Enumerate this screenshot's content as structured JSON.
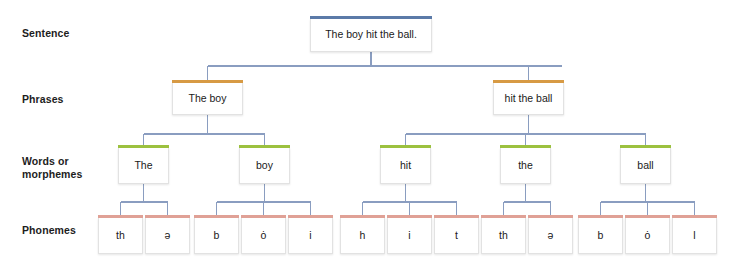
{
  "diagram": {
    "colors": {
      "sentence_cap": "#5b7aa8",
      "phrase_cap": "#d79a44",
      "word_cap": "#9cc13f",
      "phoneme_cap": "#e0a196",
      "connector": "#8a9dc0",
      "box_fill": "#ffffff",
      "box_border": "#e2e2e2",
      "label_text": "#1d1d1d"
    },
    "row_labels": [
      {
        "id": "sentence",
        "text": "Sentence",
        "y": 27
      },
      {
        "id": "phrases",
        "text": "Phrases",
        "y": 93
      },
      {
        "id": "words",
        "text": "Words or\nmorphemes",
        "y": 155
      },
      {
        "id": "phonemes",
        "text": "Phonemes",
        "y": 224
      }
    ],
    "levels": {
      "sentence": {
        "label": "Sentence",
        "nodes": [
          {
            "id": "s1",
            "text": "The boy hit the ball.",
            "x": 310,
            "y": 19,
            "w": 122,
            "h": 33
          }
        ]
      },
      "phrases": {
        "label": "Phrases",
        "nodes": [
          {
            "id": "p1",
            "text": "The boy",
            "x": 172,
            "y": 83,
            "w": 71,
            "h": 32
          },
          {
            "id": "p2",
            "text": "hit the ball",
            "x": 493,
            "y": 83,
            "w": 71,
            "h": 32
          }
        ]
      },
      "words": {
        "label": "Words or morphemes",
        "nodes": [
          {
            "id": "w1",
            "text": "The",
            "x": 118,
            "y": 148,
            "w": 51,
            "h": 36
          },
          {
            "id": "w2",
            "text": "boy",
            "x": 239,
            "y": 148,
            "w": 51,
            "h": 36
          },
          {
            "id": "w3",
            "text": "hit",
            "x": 380,
            "y": 148,
            "w": 51,
            "h": 36
          },
          {
            "id": "w4",
            "text": "the",
            "x": 500,
            "y": 148,
            "w": 51,
            "h": 36
          },
          {
            "id": "w5",
            "text": "ball",
            "x": 620,
            "y": 148,
            "w": 51,
            "h": 36
          }
        ]
      },
      "phonemes": {
        "label": "Phonemes",
        "nodes": [
          {
            "id": "ph1",
            "text": "th",
            "x": 98,
            "y": 218,
            "w": 45,
            "h": 36,
            "parent": "w1"
          },
          {
            "id": "ph2",
            "text": "ə",
            "x": 145,
            "y": 218,
            "w": 45,
            "h": 36,
            "parent": "w1"
          },
          {
            "id": "ph3",
            "text": "b",
            "x": 194,
            "y": 218,
            "w": 45,
            "h": 36,
            "parent": "w2"
          },
          {
            "id": "ph4",
            "text": "ȯ",
            "x": 241,
            "y": 218,
            "w": 45,
            "h": 36,
            "parent": "w2"
          },
          {
            "id": "ph5",
            "text": "i",
            "x": 288,
            "y": 218,
            "w": 45,
            "h": 36,
            "parent": "w2"
          },
          {
            "id": "ph6",
            "text": "h",
            "x": 340,
            "y": 218,
            "w": 45,
            "h": 36,
            "parent": "w3"
          },
          {
            "id": "ph7",
            "text": "i",
            "x": 387,
            "y": 218,
            "w": 45,
            "h": 36,
            "parent": "w3"
          },
          {
            "id": "ph8",
            "text": "t",
            "x": 434,
            "y": 218,
            "w": 45,
            "h": 36,
            "parent": "w3"
          },
          {
            "id": "ph9",
            "text": "th",
            "x": 481,
            "y": 218,
            "w": 45,
            "h": 36,
            "parent": "w4"
          },
          {
            "id": "ph10",
            "text": "ə",
            "x": 528,
            "y": 218,
            "w": 45,
            "h": 36,
            "parent": "w4"
          },
          {
            "id": "ph11",
            "text": "b",
            "x": 578,
            "y": 218,
            "w": 45,
            "h": 36,
            "parent": "w5"
          },
          {
            "id": "ph12",
            "text": "ȯ",
            "x": 625,
            "y": 218,
            "w": 45,
            "h": 36,
            "parent": "w5"
          },
          {
            "id": "ph13",
            "text": "l",
            "x": 672,
            "y": 218,
            "w": 45,
            "h": 36,
            "parent": "w5"
          }
        ]
      }
    }
  }
}
